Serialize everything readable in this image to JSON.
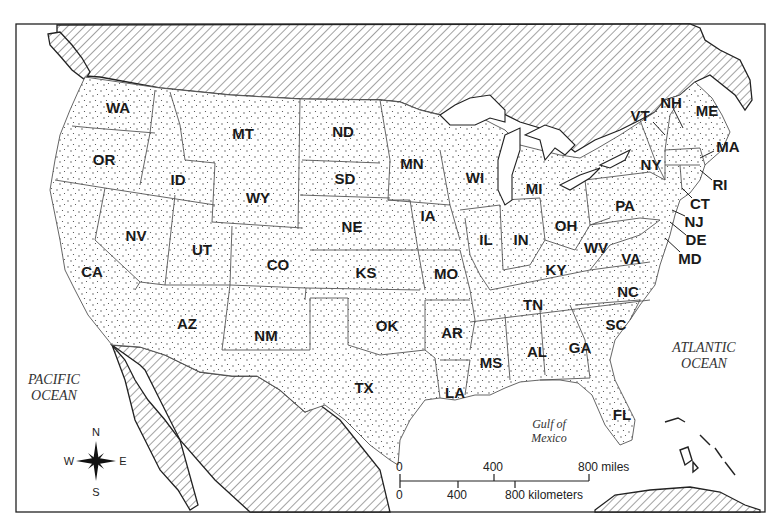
{
  "map": {
    "title": "United States political outline map",
    "states": [
      {
        "abbr": "WA",
        "x": 118,
        "y": 108
      },
      {
        "abbr": "OR",
        "x": 104,
        "y": 160
      },
      {
        "abbr": "CA",
        "x": 92,
        "y": 272
      },
      {
        "abbr": "NV",
        "x": 136,
        "y": 236
      },
      {
        "abbr": "ID",
        "x": 178,
        "y": 180
      },
      {
        "abbr": "MT",
        "x": 243,
        "y": 134
      },
      {
        "abbr": "WY",
        "x": 258,
        "y": 198
      },
      {
        "abbr": "UT",
        "x": 202,
        "y": 250
      },
      {
        "abbr": "CO",
        "x": 278,
        "y": 265
      },
      {
        "abbr": "AZ",
        "x": 187,
        "y": 324
      },
      {
        "abbr": "NM",
        "x": 266,
        "y": 336
      },
      {
        "abbr": "ND",
        "x": 343,
        "y": 132
      },
      {
        "abbr": "SD",
        "x": 345,
        "y": 179
      },
      {
        "abbr": "NE",
        "x": 352,
        "y": 227
      },
      {
        "abbr": "KS",
        "x": 366,
        "y": 273
      },
      {
        "abbr": "OK",
        "x": 387,
        "y": 326
      },
      {
        "abbr": "TX",
        "x": 364,
        "y": 388
      },
      {
        "abbr": "MN",
        "x": 412,
        "y": 164
      },
      {
        "abbr": "IA",
        "x": 428,
        "y": 216
      },
      {
        "abbr": "MO",
        "x": 446,
        "y": 274
      },
      {
        "abbr": "AR",
        "x": 452,
        "y": 333
      },
      {
        "abbr": "LA",
        "x": 455,
        "y": 393
      },
      {
        "abbr": "WI",
        "x": 475,
        "y": 178
      },
      {
        "abbr": "IL",
        "x": 486,
        "y": 240
      },
      {
        "abbr": "MI",
        "x": 534,
        "y": 189
      },
      {
        "abbr": "IN",
        "x": 521,
        "y": 240
      },
      {
        "abbr": "OH",
        "x": 566,
        "y": 226
      },
      {
        "abbr": "KY",
        "x": 556,
        "y": 270
      },
      {
        "abbr": "TN",
        "x": 533,
        "y": 305
      },
      {
        "abbr": "MS",
        "x": 491,
        "y": 363
      },
      {
        "abbr": "AL",
        "x": 537,
        "y": 352
      },
      {
        "abbr": "GA",
        "x": 580,
        "y": 348
      },
      {
        "abbr": "FL",
        "x": 622,
        "y": 415
      },
      {
        "abbr": "SC",
        "x": 616,
        "y": 325
      },
      {
        "abbr": "NC",
        "x": 628,
        "y": 292
      },
      {
        "abbr": "VA",
        "x": 631,
        "y": 259
      },
      {
        "abbr": "WV",
        "x": 596,
        "y": 248
      },
      {
        "abbr": "PA",
        "x": 625,
        "y": 206
      },
      {
        "abbr": "NY",
        "x": 651,
        "y": 165
      },
      {
        "abbr": "VT",
        "x": 640,
        "y": 116
      },
      {
        "abbr": "NH",
        "x": 671,
        "y": 103
      },
      {
        "abbr": "ME",
        "x": 707,
        "y": 111
      },
      {
        "abbr": "MA",
        "x": 728,
        "y": 147
      },
      {
        "abbr": "RI",
        "x": 720,
        "y": 185
      },
      {
        "abbr": "CT",
        "x": 700,
        "y": 204
      },
      {
        "abbr": "NJ",
        "x": 694,
        "y": 222
      },
      {
        "abbr": "DE",
        "x": 696,
        "y": 240
      },
      {
        "abbr": "MD",
        "x": 690,
        "y": 259
      }
    ],
    "water_bodies": {
      "pacific": [
        "PACIFIC",
        "OCEAN"
      ],
      "atlantic": [
        "ATLANTIC",
        "OCEAN"
      ],
      "gulf": [
        "Gulf of",
        "Mexico"
      ]
    },
    "compass": {
      "n": "N",
      "s": "S",
      "e": "E",
      "w": "W"
    },
    "scale": {
      "miles_ticks": [
        "0",
        "400",
        "800 miles"
      ],
      "km_ticks": [
        "0",
        "400",
        "800 kilometers"
      ]
    },
    "colors": {
      "ink": "#222222",
      "border": "#555555",
      "background": "#ffffff"
    }
  }
}
